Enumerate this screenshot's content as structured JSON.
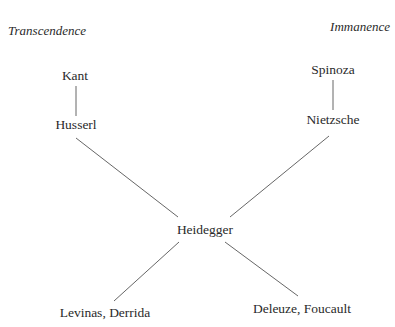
{
  "headings": {
    "left": "Transcendence",
    "right": "Immanence"
  },
  "nodes": {
    "kant": "Kant",
    "husserl": "Husserl",
    "spinoza": "Spinoza",
    "nietzsche": "Nietzsche",
    "heidegger": "Heidegger",
    "levinas_derrida": "Levinas, Derrida",
    "deleuze_foucault": "Deleuze, Foucault"
  },
  "edges": [
    [
      "Kant",
      "Husserl"
    ],
    [
      "Spinoza",
      "Nietzsche"
    ],
    [
      "Husserl",
      "Heidegger"
    ],
    [
      "Nietzsche",
      "Heidegger"
    ],
    [
      "Heidegger",
      "Levinas, Derrida"
    ],
    [
      "Heidegger",
      "Deleuze, Foucault"
    ]
  ]
}
